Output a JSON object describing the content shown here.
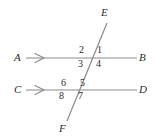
{
  "diagram": {
    "type": "geometry-figure",
    "colors": {
      "line": "#8a8a8a",
      "transversal": "#8a8a8a",
      "label": "#2b2b2b",
      "background": "#ffffff"
    },
    "points": {
      "A": "A",
      "B": "B",
      "C": "C",
      "D": "D",
      "E": "E",
      "F": "F"
    },
    "lines": [
      {
        "name": "line-AB",
        "from": "A",
        "to": "B",
        "marker": "single-arrow",
        "y": 58
      },
      {
        "name": "line-CD",
        "from": "C",
        "to": "D",
        "marker": "single-arrow",
        "y": 90
      },
      {
        "name": "line-EF",
        "from": "E",
        "to": "F",
        "marker": "none"
      }
    ],
    "angles": {
      "a1": "1",
      "a2": "2",
      "a3": "3",
      "a4": "4",
      "a5": "5",
      "a6": "6",
      "a7": "7",
      "a8": "8"
    }
  }
}
